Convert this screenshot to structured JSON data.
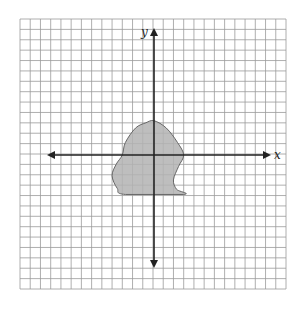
{
  "diagram": {
    "type": "coordinate-plane-with-shape",
    "axes": {
      "x_label": "x",
      "y_label": "y",
      "x_range": [
        -13,
        13
      ],
      "y_range": [
        -13,
        13
      ]
    },
    "grid": {
      "cols": 26,
      "rows": 26,
      "line_color": "#9a9a9a",
      "background": "#ffffff"
    },
    "shape": {
      "fill": "#b3b3b3",
      "stroke": "#666666",
      "description": "Irregular shaded blob spanning roughly x from -4 to 3 and y from -4 to 3.3",
      "points": [
        [
          0,
          3.3
        ],
        [
          1.2,
          2.6
        ],
        [
          2.3,
          1.2
        ],
        [
          2.9,
          0
        ],
        [
          2.4,
          -1.1
        ],
        [
          1.9,
          -2.4
        ],
        [
          2.2,
          -3.3
        ],
        [
          2.9,
          -3.8
        ],
        [
          -2.8,
          -3.8
        ],
        [
          -3.6,
          -3.2
        ],
        [
          -4.1,
          -2.0
        ],
        [
          -3.7,
          -0.9
        ],
        [
          -3.1,
          0
        ],
        [
          -2.8,
          1.2
        ],
        [
          -1.8,
          2.6
        ],
        [
          -0.8,
          3.1
        ]
      ]
    }
  }
}
